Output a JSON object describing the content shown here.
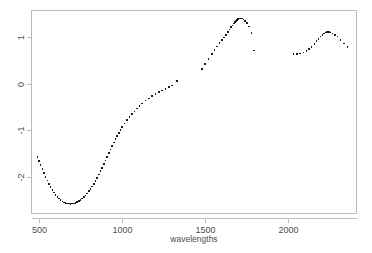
{
  "chart_data": {
    "type": "scatter",
    "title": "",
    "subtitle": "",
    "xlabel": "wavelengths",
    "ylabel": "",
    "xlim": [
      455,
      2410
    ],
    "ylim": [
      -2.78,
      1.58
    ],
    "grid": false,
    "legend": null,
    "marker": "small filled square",
    "marker_color": "#1a1a1a",
    "x_ticks": [
      500,
      1000,
      1500,
      2000
    ],
    "x_tick_labels": [
      "500",
      "1000",
      "1500",
      "2000"
    ],
    "y_ticks": [
      1,
      0,
      -1,
      -2
    ],
    "y_tick_labels": [
      "1",
      "0",
      "-1",
      "-2"
    ],
    "y_tick_label_rotation": -90,
    "series": [
      {
        "name": "spectrum",
        "x": [
          490,
          500,
          510,
          520,
          530,
          540,
          550,
          560,
          570,
          580,
          590,
          600,
          610,
          620,
          630,
          640,
          650,
          660,
          670,
          680,
          690,
          700,
          710,
          720,
          730,
          740,
          750,
          760,
          770,
          780,
          790,
          800,
          810,
          820,
          830,
          840,
          850,
          860,
          870,
          880,
          890,
          900,
          910,
          920,
          930,
          940,
          950,
          960,
          970,
          980,
          990,
          1000,
          1015,
          1030,
          1045,
          1060,
          1075,
          1090,
          1105,
          1120,
          1140,
          1160,
          1180,
          1200,
          1220,
          1240,
          1260,
          1280,
          1300,
          1330,
          1480,
          1500,
          1520,
          1540,
          1555,
          1570,
          1585,
          1600,
          1612,
          1624,
          1636,
          1646,
          1656,
          1664,
          1672,
          1680,
          1686,
          1692,
          1698,
          1704,
          1710,
          1716,
          1722,
          1730,
          1740,
          1752,
          1764,
          1778,
          1792,
          2030,
          2050,
          2070,
          2090,
          2108,
          2124,
          2140,
          2156,
          2170,
          2182,
          2194,
          2204,
          2214,
          2224,
          2234,
          2244,
          2254,
          2266,
          2280,
          2296,
          2314,
          2334,
          2356
        ],
        "y": [
          -1.57,
          -1.66,
          -1.75,
          -1.83,
          -1.92,
          -2.0,
          -2.08,
          -2.15,
          -2.22,
          -2.28,
          -2.34,
          -2.39,
          -2.43,
          -2.47,
          -2.5,
          -2.53,
          -2.55,
          -2.56,
          -2.57,
          -2.575,
          -2.58,
          -2.578,
          -2.572,
          -2.56,
          -2.545,
          -2.525,
          -2.5,
          -2.47,
          -2.44,
          -2.4,
          -2.36,
          -2.31,
          -2.26,
          -2.21,
          -2.15,
          -2.09,
          -2.02,
          -1.95,
          -1.88,
          -1.81,
          -1.73,
          -1.65,
          -1.57,
          -1.49,
          -1.41,
          -1.33,
          -1.26,
          -1.19,
          -1.12,
          -1.05,
          -0.99,
          -0.93,
          -0.85,
          -0.78,
          -0.71,
          -0.65,
          -0.59,
          -0.53,
          -0.47,
          -0.42,
          -0.36,
          -0.31,
          -0.26,
          -0.22,
          -0.18,
          -0.14,
          -0.105,
          -0.07,
          -0.035,
          0.06,
          0.32,
          0.43,
          0.54,
          0.64,
          0.73,
          0.81,
          0.88,
          0.95,
          1.0,
          1.06,
          1.12,
          1.17,
          1.22,
          1.26,
          1.3,
          1.34,
          1.36,
          1.38,
          1.395,
          1.405,
          1.41,
          1.41,
          1.405,
          1.39,
          1.36,
          1.31,
          1.24,
          1.1,
          0.72,
          0.64,
          0.645,
          0.655,
          0.68,
          0.71,
          0.75,
          0.8,
          0.86,
          0.92,
          0.97,
          1.02,
          1.06,
          1.09,
          1.11,
          1.12,
          1.12,
          1.11,
          1.09,
          1.06,
          1.02,
          0.95,
          0.87,
          0.79
        ]
      }
    ],
    "notes": [
      "gap in data between 1330 and 1480",
      "gap in data between 1792 and 2030"
    ]
  },
  "plot": {
    "background_color": "#ffffff",
    "frame_color": "#b4b4b4",
    "text_color": "#4d4d4d"
  }
}
